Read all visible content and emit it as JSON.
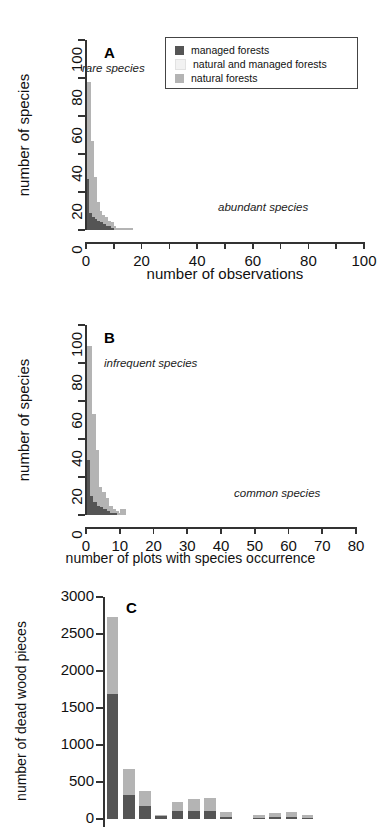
{
  "figure": {
    "legend": {
      "items": [
        {
          "label": "managed forests",
          "color": "#555555",
          "key": "managed"
        },
        {
          "label": "natural and managed forests",
          "color": "#f2f2f2",
          "key": "both"
        },
        {
          "label": "natural forests",
          "color": "#b4b4b4",
          "key": "natural"
        }
      ]
    },
    "panels": [
      {
        "letter": "A",
        "annotation_left": "rare species",
        "annotation_right": "abundant species",
        "xlabel": "number of observations",
        "ylabel": "number of species"
      },
      {
        "letter": "B",
        "annotation_left": "infrequent species",
        "annotation_right": "common species",
        "xlabel": "number of plots with species occurrence",
        "ylabel": "number of species"
      },
      {
        "letter": "C",
        "annotation_left": "",
        "annotation_right": "",
        "xlabel": "",
        "ylabel": "number of dead wood pieces"
      }
    ]
  },
  "chart_data": [
    {
      "type": "bar",
      "panel": "A",
      "title": "A",
      "xlabel": "number of observations",
      "ylabel": "number of species",
      "xlim": [
        0,
        100
      ],
      "ylim": [
        0,
        100
      ],
      "xticks": [
        0,
        10,
        20,
        30,
        40,
        50,
        60,
        70,
        80,
        90,
        100
      ],
      "xticklabels": [
        "0",
        "",
        "20",
        "",
        "40",
        "",
        "60",
        "",
        "80",
        "",
        "100"
      ],
      "yticks": [
        0,
        20,
        40,
        60,
        80,
        100
      ],
      "yticklabels": [
        "0",
        "20",
        "40",
        "60",
        "80",
        "100"
      ],
      "grid": false,
      "stacked": true,
      "annotations": [
        {
          "text": "rare species",
          "x": 6,
          "y": 86
        },
        {
          "text": "abundant species",
          "x": 62,
          "y": 11
        }
      ],
      "x": [
        1,
        2,
        3,
        4,
        5,
        6,
        7,
        8,
        9,
        10,
        11,
        12,
        13,
        14,
        15,
        16
      ],
      "series": [
        {
          "name": "managed forests",
          "color": "#555555",
          "values": [
            27,
            9,
            7,
            6,
            5,
            4,
            3,
            2,
            2,
            1,
            0,
            0,
            0,
            0,
            0,
            0
          ]
        },
        {
          "name": "natural and managed forests",
          "color": "#f2f2f2",
          "values": [
            0,
            0,
            0,
            0,
            0,
            0,
            0,
            0,
            0,
            0,
            0,
            0,
            0,
            0,
            0,
            0
          ]
        },
        {
          "name": "natural forests",
          "color": "#b4b4b4",
          "values": [
            51,
            38,
            21,
            9,
            5,
            4,
            4,
            3,
            2,
            1,
            1,
            1,
            1,
            1,
            1,
            1
          ]
        }
      ]
    },
    {
      "type": "bar",
      "panel": "B",
      "title": "B",
      "xlabel": "number of plots with species occurrence",
      "ylabel": "number of species",
      "xlim": [
        0,
        80
      ],
      "ylim": [
        0,
        100
      ],
      "xticks": [
        0,
        10,
        20,
        30,
        40,
        50,
        60,
        70,
        80
      ],
      "xticklabels": [
        "0",
        "10",
        "20",
        "30",
        "40",
        "50",
        "60",
        "70",
        "80"
      ],
      "yticks": [
        0,
        20,
        40,
        60,
        80,
        100
      ],
      "yticklabels": [
        "0",
        "20",
        "40",
        "60",
        "80",
        "100"
      ],
      "grid": false,
      "stacked": true,
      "annotations": [
        {
          "text": "infrequent species",
          "x": 5,
          "y": 80
        },
        {
          "text": "common species",
          "x": 50,
          "y": 11
        }
      ],
      "x": [
        1,
        2,
        3,
        4,
        5,
        6,
        7,
        8,
        9,
        10,
        11
      ],
      "series": [
        {
          "name": "managed forests",
          "color": "#555555",
          "values": [
            29,
            10,
            7,
            5,
            4,
            3,
            2,
            1,
            1,
            0,
            0
          ]
        },
        {
          "name": "natural and managed forests",
          "color": "#f2f2f2",
          "values": [
            0,
            0,
            0,
            0,
            0,
            0,
            0,
            0,
            0,
            0,
            0
          ]
        },
        {
          "name": "natural forests",
          "color": "#b4b4b4",
          "values": [
            60,
            43,
            27,
            10,
            8,
            6,
            3,
            2,
            1,
            1,
            3
          ]
        }
      ]
    },
    {
      "type": "bar",
      "panel": "C",
      "title": "C",
      "xlabel": "",
      "ylabel": "number of dead wood pieces",
      "ylim": [
        0,
        3000
      ],
      "yticks": [
        0,
        500,
        1000,
        1500,
        2000,
        2500,
        3000
      ],
      "yticklabels": [
        "0",
        "500",
        "1000",
        "1500",
        "2000",
        "2500",
        "3000"
      ],
      "grid": false,
      "stacked": true,
      "note": "x-axis is cut off below the bottom edge of the screenshot",
      "categories": [
        "1",
        "2",
        "3",
        "4",
        "5",
        "6",
        "7",
        "8",
        "9",
        "10",
        "11",
        "12",
        "13",
        "14",
        "15",
        "16"
      ],
      "series": [
        {
          "name": "managed forests",
          "color": "#555555",
          "values": [
            1690,
            330,
            180,
            40,
            110,
            110,
            105,
            30,
            0,
            20,
            25,
            30,
            15,
            0,
            0,
            0
          ]
        },
        {
          "name": "natural forests",
          "color": "#b4b4b4",
          "values": [
            1040,
            350,
            200,
            20,
            120,
            155,
            180,
            60,
            0,
            30,
            50,
            70,
            35,
            0,
            0,
            0
          ]
        }
      ]
    }
  ]
}
